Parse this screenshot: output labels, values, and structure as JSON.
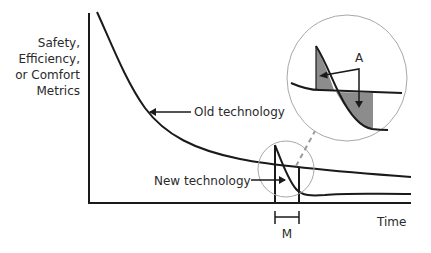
{
  "diagram": {
    "y_axis_label": [
      "Safety,",
      "Efficiency,",
      "or Comfort",
      "Metrics"
    ],
    "x_axis_label": "Time",
    "curves": {
      "old": {
        "label": "Old technology"
      },
      "new": {
        "label": "New technology"
      }
    },
    "inset": {
      "annotation": "A"
    },
    "interval_label": "M",
    "colors": {
      "line": "#1a1a1a",
      "shade": "#8c8c8c",
      "circle": "#a8a8a8",
      "dashed_arrow": "#9a9a9a",
      "text": "#2a2a2a"
    }
  }
}
